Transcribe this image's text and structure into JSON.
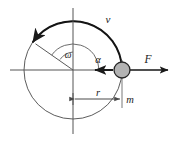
{
  "figure": {
    "title": "",
    "kind": "physics-diagram-circular-motion",
    "background_color": "#ffffff",
    "line_color": "#1a1a1a",
    "thin_line_color": "#3a3a3a",
    "mass_fill_color": "#b3b3b3",
    "mass_stroke_color": "#262626"
  },
  "labels": {
    "velocity": "v",
    "angular_velocity": "ω",
    "angle": "α",
    "radius": "r",
    "mass": "m",
    "force": "F"
  },
  "geometry": {
    "center_x": 73,
    "center_y": 70,
    "radius_px": 49,
    "mass_point_x": 122,
    "mass_point_y": 70,
    "mass_dot_radius_px": 8,
    "velocity_arc_start_deg": 0,
    "velocity_arc_end_deg": 145,
    "radius_line_angle_deg": 145,
    "force_arrow_tip_x": 170,
    "alpha_arrow_tip_x": 94,
    "dimension_line_y": 99,
    "h_axis_left_x": 10,
    "h_axis_right_x": 170,
    "v_axis_top_y": 8,
    "v_axis_bottom_y": 134
  },
  "annotations": {
    "omega_arc_label_x": 68,
    "omega_arc_label_y": 56,
    "alpha_label_x": 97,
    "alpha_label_y": 61,
    "velocity_label_x": 108,
    "velocity_label_y": 21,
    "force_label_x": 147,
    "force_label_y": 62,
    "radius_label_x": 97,
    "radius_label_y": 95,
    "mass_label_x": 128,
    "mass_label_y": 101
  }
}
